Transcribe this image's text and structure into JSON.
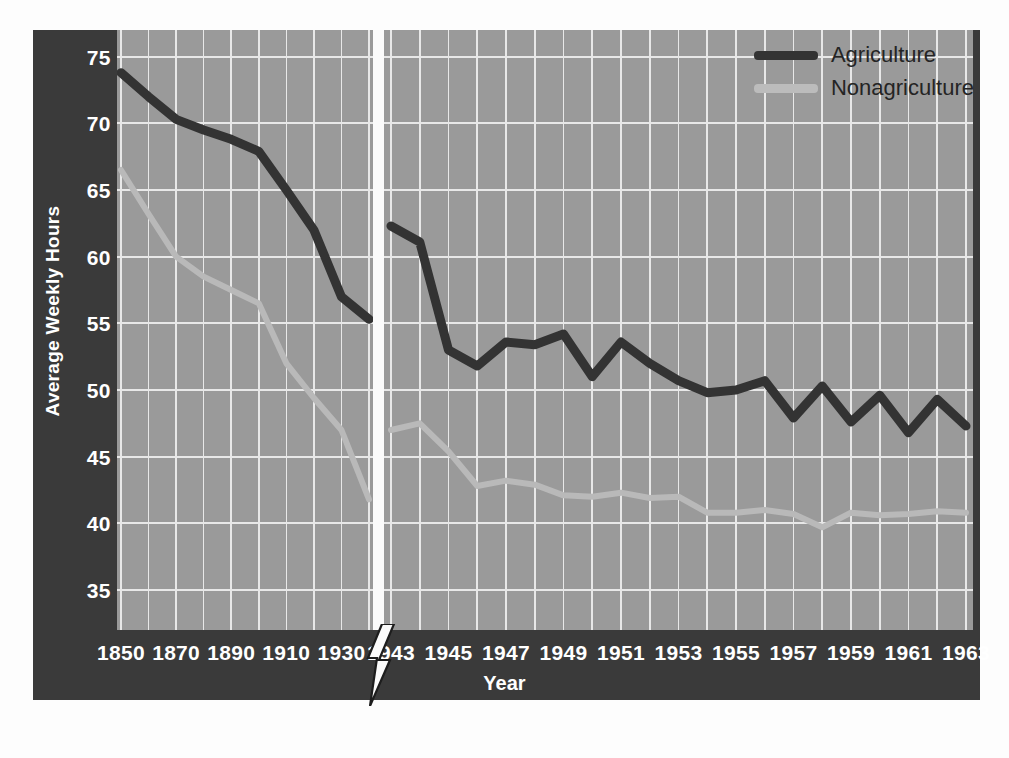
{
  "chart_data": {
    "type": "line",
    "title": "",
    "xlabel": "Year",
    "ylabel": "Average Weekly Hours",
    "ylim": [
      32,
      77
    ],
    "yticks": [
      35,
      40,
      45,
      50,
      55,
      60,
      65,
      70,
      75
    ],
    "grid": true,
    "legend_position": "top-right",
    "axis_break": {
      "between": [
        "1940",
        "1943"
      ],
      "style": "lightning-bolt"
    },
    "x_tick_labels": [
      "1850",
      "1870",
      "1890",
      "1910",
      "1930",
      "1943",
      "1945",
      "1947",
      "1949",
      "1951",
      "1953",
      "1955",
      "1957",
      "1959",
      "1961",
      "1963"
    ],
    "panels": [
      {
        "name": "early",
        "x": [
          1850,
          1860,
          1870,
          1880,
          1890,
          1900,
          1910,
          1920,
          1930,
          1940
        ],
        "series": [
          {
            "name": "Agriculture",
            "values": [
              73.8,
              72.0,
              70.3,
              69.5,
              68.8,
              67.9,
              65.0,
              62.0,
              57.0,
              55.3
            ]
          },
          {
            "name": "Nonagriculture",
            "values": [
              66.5,
              63.2,
              60.0,
              58.5,
              57.5,
              56.5,
              52.0,
              49.4,
              47.0,
              41.8
            ]
          }
        ]
      },
      {
        "name": "late",
        "x": [
          1943,
          1944,
          1945,
          1946,
          1947,
          1948,
          1949,
          1950,
          1951,
          1952,
          1953,
          1954,
          1955,
          1956,
          1957,
          1958,
          1959,
          1960,
          1961,
          1962,
          1963
        ],
        "series": [
          {
            "name": "Agriculture",
            "values": [
              62.3,
              61.1,
              53.0,
              51.8,
              53.6,
              53.4,
              54.2,
              51.0,
              53.6,
              52.0,
              50.7,
              49.8,
              50.0,
              50.7,
              47.9,
              50.3,
              47.6,
              49.6,
              46.8,
              49.3,
              47.3
            ]
          },
          {
            "name": "Nonagriculture",
            "values": [
              47.0,
              47.5,
              45.4,
              42.8,
              43.2,
              42.9,
              42.1,
              42.0,
              42.3,
              41.9,
              42.0,
              40.8,
              40.8,
              41.0,
              40.7,
              39.7,
              40.8,
              40.6,
              40.7,
              40.9,
              40.8
            ]
          }
        ]
      }
    ],
    "series_colors": {
      "Agriculture": "#333333",
      "Nonagriculture": "#b9b9b9"
    }
  },
  "legend": {
    "items": [
      {
        "label": "Agriculture",
        "color": "#333333"
      },
      {
        "label": "Nonagriculture",
        "color": "#bcbcbc"
      }
    ]
  },
  "axes": {
    "y_title": "Average Weekly Hours",
    "x_title": "Year"
  },
  "colors": {
    "frame": "#3a3a3a",
    "plot_background": "#9a9a9a",
    "gridline": "#e8e8e8",
    "tick_text": "#ffffff",
    "break_band": "#fbfbfb"
  }
}
